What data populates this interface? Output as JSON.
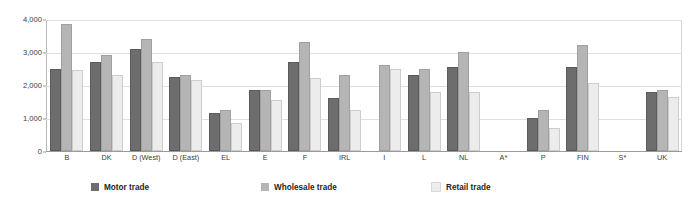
{
  "chart_data": {
    "type": "bar",
    "title": "",
    "xlabel": "",
    "ylabel": "",
    "ylim": [
      0,
      4000
    ],
    "yticks": [
      0,
      1000,
      2000,
      3000,
      4000
    ],
    "ytick_labels": [
      "0",
      "1,000",
      "2,000",
      "3,000",
      "4,000"
    ],
    "grid": true,
    "legend_position": "bottom",
    "categories": [
      "B",
      "DK",
      "D (West)",
      "D (East)",
      "EL",
      "E",
      "F",
      "IRL",
      "I",
      "L",
      "NL",
      "A*",
      "P",
      "FIN",
      "S*",
      "UK"
    ],
    "series": [
      {
        "name": "Motor trade",
        "color": "#6d6d6d",
        "values": [
          2500,
          2700,
          3100,
          2250,
          1150,
          1850,
          2700,
          1600,
          null,
          2300,
          2550,
          null,
          1000,
          2550,
          null,
          1800
        ]
      },
      {
        "name": "Wholesale trade",
        "color": "#b5b5b5",
        "values": [
          3850,
          2900,
          3400,
          2300,
          1250,
          1850,
          3300,
          2300,
          2600,
          2500,
          3000,
          null,
          1250,
          3200,
          null,
          1850
        ]
      },
      {
        "name": "Retail trade",
        "color": "#ececec",
        "values": [
          2450,
          2300,
          2700,
          2150,
          850,
          1550,
          2200,
          1250,
          2500,
          1800,
          1800,
          null,
          700,
          2050,
          null,
          1650
        ]
      }
    ]
  },
  "legend": {
    "items": [
      {
        "label": "Motor trade",
        "color": "#6d6d6d"
      },
      {
        "label": "Wholesale trade",
        "color": "#b5b5b5"
      },
      {
        "label": "Retail trade",
        "color": "#ececec"
      }
    ]
  }
}
